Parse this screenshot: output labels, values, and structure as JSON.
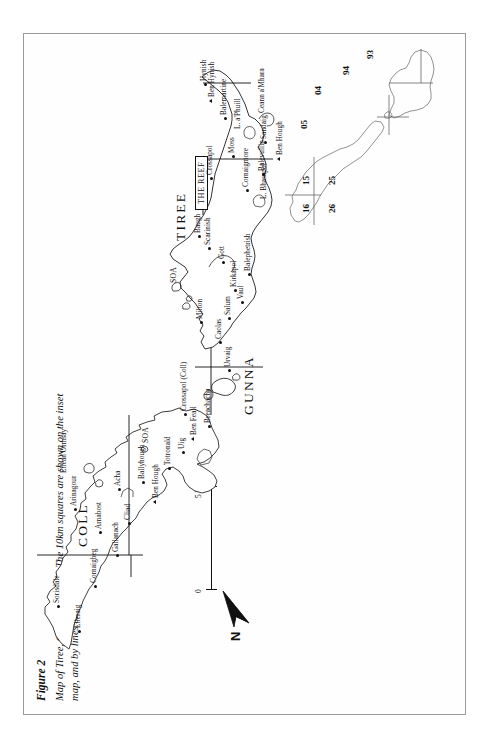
{
  "figure": {
    "title": "Figure 2",
    "caption": "Map of Tiree, Gunna and Coll. The 10km squares are shown on the inset map, and by lines on the larger map."
  },
  "legend": {
    "north_label": "N",
    "scale": {
      "min_label": "0",
      "max_label": "5 km",
      "unit": "km",
      "length_km": 5
    }
  },
  "regions": [
    {
      "name": "COLL",
      "x": 185,
      "y": 60
    },
    {
      "name": "GUNNA",
      "x": 320,
      "y": 222
    },
    {
      "name": "TIREE",
      "x": 470,
      "y": 210
    }
  ],
  "area_markers": [
    {
      "label": "SOA",
      "x": 272,
      "y": 122
    },
    {
      "label": "SOA",
      "x": 432,
      "y": 135
    }
  ],
  "reef_label": "THE REEF",
  "places": [
    {
      "name": "Eileraig",
      "x": 83,
      "y": 56,
      "marker": "dot"
    },
    {
      "name": "Sorisdale",
      "x": 108,
      "y": 35,
      "marker": "dot"
    },
    {
      "name": "Cornaigbeg",
      "x": 128,
      "y": 72,
      "marker": "dot"
    },
    {
      "name": "Gallanach",
      "x": 159,
      "y": 94,
      "marker": "dot"
    },
    {
      "name": "Arnabost",
      "x": 182,
      "y": 77,
      "marker": "dot"
    },
    {
      "name": "Cliad",
      "x": 191,
      "y": 106,
      "marker": "dot"
    },
    {
      "name": "Arinagour",
      "x": 205,
      "y": 52,
      "marker": "dot"
    },
    {
      "name": "Eilean Ormsay",
      "x": 238,
      "y": 42,
      "marker": "none"
    },
    {
      "name": "Acha",
      "x": 225,
      "y": 96,
      "marker": "dot"
    },
    {
      "name": "Ben Hough",
      "x": 213,
      "y": 134,
      "marker": "tri"
    },
    {
      "name": "Ballyhough",
      "x": 232,
      "y": 120,
      "marker": "dot"
    },
    {
      "name": "Totronald",
      "x": 246,
      "y": 146,
      "marker": "dot"
    },
    {
      "name": "Uig",
      "x": 262,
      "y": 160,
      "marker": "dot"
    },
    {
      "name": "Ben Feall",
      "x": 276,
      "y": 172,
      "marker": "tri"
    },
    {
      "name": "Breachacha",
      "x": 288,
      "y": 186,
      "marker": "dot"
    },
    {
      "name": "Crossapol (Coll)",
      "x": 300,
      "y": 162,
      "marker": "dot"
    },
    {
      "name": "Urvaig",
      "x": 344,
      "y": 206,
      "marker": "dot"
    },
    {
      "name": "Caolas",
      "x": 372,
      "y": 197,
      "marker": "dot"
    },
    {
      "name": "Milton",
      "x": 392,
      "y": 178,
      "marker": "dot"
    },
    {
      "name": "Salum",
      "x": 396,
      "y": 206,
      "marker": "dot"
    },
    {
      "name": "Vaul",
      "x": 412,
      "y": 219,
      "marker": "dot"
    },
    {
      "name": "Kirkapol",
      "x": 424,
      "y": 212,
      "marker": "dot"
    },
    {
      "name": "Balephetrish",
      "x": 440,
      "y": 226,
      "marker": "dot"
    },
    {
      "name": "Gott",
      "x": 452,
      "y": 200,
      "marker": "dot"
    },
    {
      "name": "Scarinish",
      "x": 466,
      "y": 186,
      "marker": "dot"
    },
    {
      "name": "Baugh",
      "x": 478,
      "y": 176,
      "marker": "dot"
    },
    {
      "name": "L. Bhasapol",
      "x": 512,
      "y": 242,
      "marker": "none"
    },
    {
      "name": "Cornaigmore",
      "x": 524,
      "y": 224,
      "marker": "dot"
    },
    {
      "name": "Balevullin",
      "x": 540,
      "y": 240,
      "marker": "dot"
    },
    {
      "name": "Ben Hough",
      "x": 556,
      "y": 258,
      "marker": "tri"
    },
    {
      "name": "Sandaig",
      "x": 572,
      "y": 242,
      "marker": "dot"
    },
    {
      "name": "Moss",
      "x": 558,
      "y": 210,
      "marker": "dot"
    },
    {
      "name": "Crossapol",
      "x": 536,
      "y": 188,
      "marker": "dot"
    },
    {
      "name": "L. a'Phuill",
      "x": 582,
      "y": 216,
      "marker": "none"
    },
    {
      "name": "Ceann a'Mhara",
      "x": 598,
      "y": 240,
      "marker": "none"
    },
    {
      "name": "Balemartine",
      "x": 596,
      "y": 202,
      "marker": "dot"
    },
    {
      "name": "Ben Hynish",
      "x": 614,
      "y": 190,
      "marker": "tri"
    },
    {
      "name": "Hynish",
      "x": 630,
      "y": 182,
      "marker": "dot"
    }
  ],
  "inset": {
    "grid_numbers": [
      {
        "value": "16",
        "x": 22,
        "y": 20
      },
      {
        "value": "26",
        "x": 22,
        "y": 46
      },
      {
        "value": "15",
        "x": 50,
        "y": 20
      },
      {
        "value": "25",
        "x": 50,
        "y": 46
      },
      {
        "value": "05",
        "x": 106,
        "y": 18
      },
      {
        "value": "04",
        "x": 140,
        "y": 32
      },
      {
        "value": "94",
        "x": 160,
        "y": 60
      },
      {
        "value": "93",
        "x": 176,
        "y": 84
      }
    ]
  }
}
